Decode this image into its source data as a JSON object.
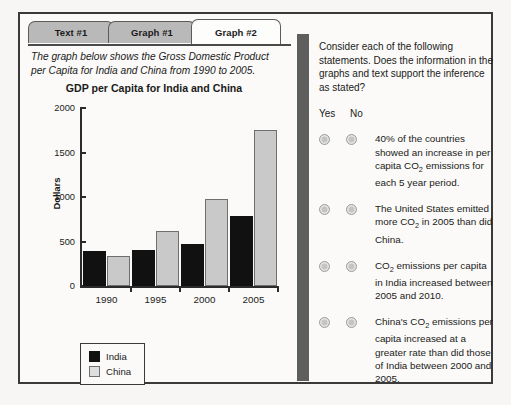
{
  "tabs": [
    {
      "label": "Text #1",
      "active": false
    },
    {
      "label": "Graph #1",
      "active": false
    },
    {
      "label": "Graph #2",
      "active": true
    }
  ],
  "left_panel": {
    "prompt": "The graph below shows the Gross Domestic Product per Capita for India and China from 1990 to 2005."
  },
  "chart_data": {
    "type": "bar",
    "title": "GDP per Capita for India and China",
    "xlabel": "",
    "ylabel": "Dollars",
    "categories": [
      "1990",
      "1995",
      "2000",
      "2005"
    ],
    "series": [
      {
        "name": "India",
        "color": "#111111",
        "values": [
          370,
          380,
          450,
          760
        ]
      },
      {
        "name": "China",
        "color": "#c9c9c9",
        "values": [
          315,
          600,
          950,
          1730
        ]
      }
    ],
    "yticks": [
      0,
      500,
      1000,
      1500,
      2000
    ],
    "ylim": [
      0,
      2000
    ],
    "grid": false,
    "legend_position": "below-left",
    "legend": [
      "India",
      "China"
    ]
  },
  "right_panel": {
    "instructions": "Consider each of the following statements. Does the information in the graphs and text support the inference as stated?",
    "yes_label": "Yes",
    "no_label": "No",
    "questions": [
      {
        "id": "q1",
        "parts": [
          "40% of the countries showed an increase in per capita CO",
          "2",
          " emissions for each 5 year period."
        ]
      },
      {
        "id": "q2",
        "parts": [
          "The United States emitted more CO",
          "2",
          " in 2005 than did China."
        ]
      },
      {
        "id": "q3",
        "parts": [
          "CO",
          "2",
          " emissions per capita in India increased between 2005 and 2010."
        ]
      },
      {
        "id": "q4",
        "parts": [
          "China's CO",
          "2",
          " emissions per capita increased at a greater rate than did those of India between 2000 and 2005."
        ]
      }
    ]
  },
  "colors": {
    "divider": "#5e5e5e",
    "frame": "#3a3a3a",
    "tab_inactive": "#b9b9b9",
    "tab_active": "#fdfdfc",
    "radio": "#c4c4c4"
  }
}
